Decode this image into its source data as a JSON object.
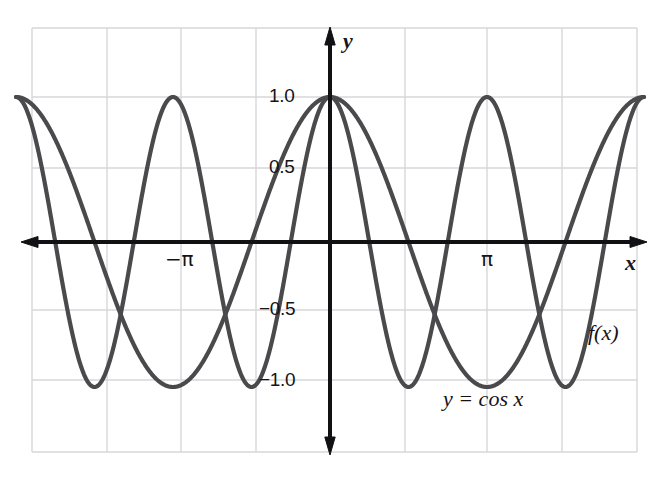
{
  "chart_data": {
    "type": "line",
    "title": "",
    "subtitle": "",
    "xlabel": "x",
    "ylabel": "y",
    "xlim": [
      -6.2832,
      6.2832
    ],
    "ylim": [
      -1.45,
      1.52
    ],
    "grid": true,
    "grid_x_values": [
      -6.2832,
      -4.7124,
      -3.1416,
      -1.5708,
      0,
      1.5708,
      3.1416,
      4.7124,
      6.2832
    ],
    "grid_y_values": [
      1.45,
      1.0,
      0.5,
      0,
      -0.5,
      -1.0,
      -1.45
    ],
    "xticks": [
      -3.1416,
      3.1416
    ],
    "xtick_labels": [
      "−π",
      "π"
    ],
    "yticks": [
      1.0,
      0.5,
      -0.5,
      -1.0
    ],
    "ytick_labels": [
      "1.0",
      "0.5",
      "−0.5",
      "−1.0"
    ],
    "legend": "none",
    "annotations": [
      {
        "text": "f(x)",
        "x": 5.45,
        "y": -0.62
      },
      {
        "text": "y = cos x",
        "x": 2.3,
        "y": -1.13
      }
    ],
    "series": [
      {
        "name": "y = cos x",
        "expression": "cos(x)",
        "amplitude": 1,
        "period": 6.2832,
        "color": "#4a4a4d",
        "maxima_x": [
          -6.2832,
          0,
          6.2832
        ],
        "minima_x": [
          -3.1416,
          3.1416
        ],
        "zeros_x": [
          -4.7124,
          -1.5708,
          1.5708,
          4.7124
        ]
      },
      {
        "name": "f(x)",
        "expression": "cos(2x)",
        "amplitude": 1,
        "period": 3.1416,
        "color": "#4a4a4d",
        "maxima_x": [
          -6.2832,
          -3.1416,
          0,
          3.1416,
          6.2832
        ],
        "minima_x": [
          -4.7124,
          -1.5708,
          1.5708,
          4.7124
        ],
        "zeros_x": [
          -5.4978,
          -3.927,
          -2.3562,
          -0.7854,
          0.7854,
          2.3562,
          3.927,
          5.4978
        ]
      }
    ]
  },
  "labels": {
    "y_axis": "y",
    "x_axis": "x",
    "tick_1_0": "1.0",
    "tick_0_5": "0.5",
    "tick_neg_0_5": "−0.5",
    "tick_neg_1_0": "−1.0",
    "tick_neg_pi": "−π",
    "tick_pi": "π",
    "curve_fx": "f(x)",
    "curve_cos": "y = cos x"
  },
  "colors": {
    "curve": "#4a4a4d",
    "axis": "#111114",
    "grid": "#d7d7da",
    "background": "#ffffff",
    "text": "#141417"
  }
}
